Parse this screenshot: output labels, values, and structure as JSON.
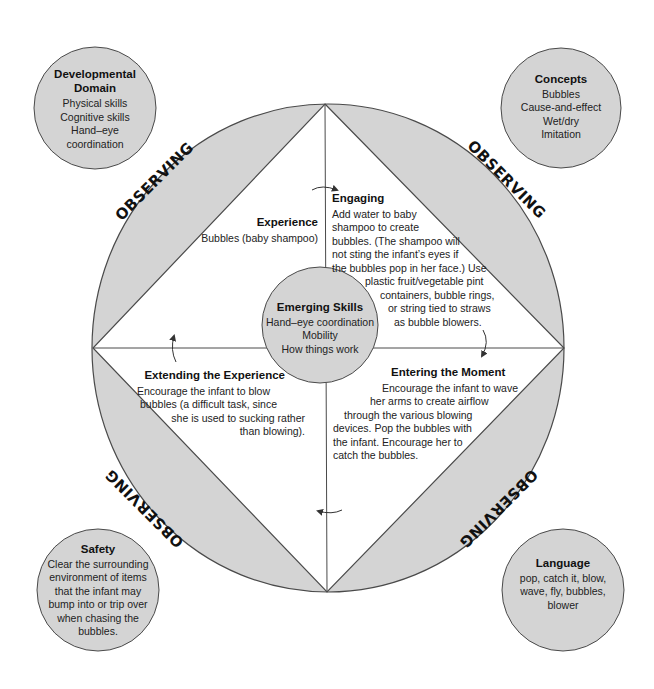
{
  "colors": {
    "fill_gray": "#d4d4d4",
    "stroke": "#4a4a4a",
    "background": "#ffffff",
    "text": "#222222"
  },
  "observing_label": "OBSERVING",
  "outer_segments": [
    {
      "position": "top-left",
      "label": "OBSERVING"
    },
    {
      "position": "top-right",
      "label": "OBSERVING"
    },
    {
      "position": "bottom-left",
      "label": "OBSERVING"
    },
    {
      "position": "bottom-right",
      "label": "OBSERVING"
    }
  ],
  "corner_circles": {
    "developmental_domain": {
      "title_lines": [
        "Developmental",
        "Domain"
      ],
      "items": [
        "Physical skills",
        "Cognitive skills",
        "Hand–eye",
        "coordination"
      ]
    },
    "concepts": {
      "title": "Concepts",
      "items": [
        "Bubbles",
        "Cause-and-effect",
        "Wet/dry",
        "Imitation"
      ]
    },
    "safety": {
      "title": "Safety",
      "lines": [
        "Clear the surrounding",
        "environment of items",
        "that the infant may",
        "bump into or trip over",
        "when chasing the",
        "bubbles."
      ]
    },
    "language": {
      "title": "Language",
      "lines": [
        "pop, catch it, blow,",
        "wave, fly, bubbles,",
        "blower"
      ]
    }
  },
  "center_circle": {
    "title": "Emerging Skills",
    "items": [
      "Hand–eye coordination",
      "Mobility",
      "How things work"
    ]
  },
  "quadrants": {
    "experience": {
      "title": "Experience",
      "lines": [
        "Bubbles (baby shampoo)"
      ]
    },
    "engaging": {
      "title": "Engaging",
      "lines": [
        "Add water to baby",
        "shampoo to create",
        "bubbles. (The shampoo will",
        "not sting the infant’s eyes if",
        "the bubbles pop in her face.) Use",
        "plastic fruit/vegetable pint",
        "containers, bubble rings,",
        "or string tied to straws",
        "as bubble blowers."
      ]
    },
    "entering_the_moment": {
      "title": "Entering the Moment",
      "lines": [
        "Encourage the infant to wave",
        "her arms to create airflow",
        "through the various blowing",
        "devices. Pop the bubbles with",
        "the infant. Encourage her to",
        "catch the bubbles."
      ]
    },
    "extending_the_experience": {
      "title": "Extending the Experience",
      "lines": [
        "Encourage the infant to blow",
        "bubbles (a difficult task, since",
        "she is used to sucking rather",
        "than blowing)."
      ]
    }
  },
  "cycle_arrows": [
    "experience-to-engaging",
    "engaging-to-entering",
    "entering-to-extending",
    "extending-to-experience"
  ]
}
